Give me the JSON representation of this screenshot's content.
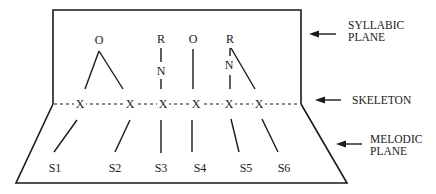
{
  "diagram": {
    "planes": {
      "syllabic": {
        "line1": "SYLLABIC",
        "line2": "PLANE"
      },
      "skeleton": {
        "label": "SKELETON"
      },
      "melodic": {
        "line1": "MELODIC",
        "line2": "PLANE"
      }
    },
    "syllabic_nodes": [
      {
        "label": "O"
      },
      {
        "label": "R"
      },
      {
        "label": "N"
      },
      {
        "label": "O"
      },
      {
        "label": "R"
      },
      {
        "label": "N"
      }
    ],
    "skeleton_slots": [
      "X",
      "X",
      "X",
      "X",
      "X",
      "X"
    ],
    "melodic_segments": [
      "S1",
      "S2",
      "S3",
      "S4",
      "S5",
      "S6"
    ],
    "colors": {
      "ink": "#1a1a1a",
      "background": "#ffffff"
    }
  }
}
